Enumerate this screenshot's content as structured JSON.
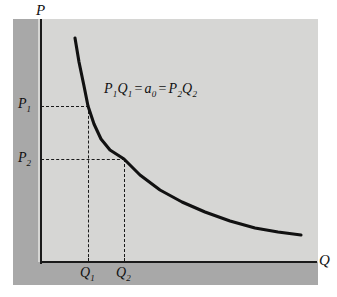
{
  "figure": {
    "background_color": "#ffffff",
    "panel_color": "#d6d6d4",
    "shadow_color": "#a8a8a8",
    "axis_color": "#1a1a1a",
    "curve_color": "#111111"
  },
  "axes": {
    "y_label": "P",
    "x_label": "Q"
  },
  "ticks": {
    "y": [
      {
        "id": "p1",
        "base": "P",
        "sub": "1"
      },
      {
        "id": "p2",
        "base": "P",
        "sub": "2"
      }
    ],
    "x": [
      {
        "id": "q1",
        "base": "Q",
        "sub": "1"
      },
      {
        "id": "q2",
        "base": "Q",
        "sub": "2"
      }
    ]
  },
  "annotation": {
    "equation_parts": [
      {
        "base": "P",
        "sub": "1"
      },
      {
        "base": "Q",
        "sub": "1"
      },
      {
        "op": "="
      },
      {
        "base": "a",
        "sub": "0"
      },
      {
        "op": "="
      },
      {
        "base": "P",
        "sub": "2"
      },
      {
        "base": "Q",
        "sub": "2"
      }
    ],
    "equation_text": "P1Q1 = a0 = P2Q2"
  },
  "chart_data": {
    "type": "line",
    "title": "",
    "xlabel": "Q",
    "ylabel": "P",
    "grid": false,
    "legend": null,
    "curve_name": "unit-elastic demand curve (rectangular hyperbola)",
    "relation": "P * Q = a0",
    "x": [
      75,
      79,
      84,
      88,
      94,
      101,
      110,
      124,
      140,
      160,
      182,
      205,
      230,
      255,
      278,
      301
    ],
    "y": [
      38,
      62,
      86,
      106,
      124,
      139,
      150,
      159,
      175,
      190,
      202,
      212,
      221,
      228,
      232,
      235
    ],
    "marked_points": [
      {
        "label": "P1Q1",
        "x_label": "Q1",
        "y_label": "P1",
        "x_px": 88,
        "y_px": 106
      },
      {
        "label": "P2Q2",
        "x_label": "Q2",
        "y_label": "P2",
        "x_px": 124,
        "y_px": 159
      }
    ],
    "annotations": [
      "P1Q1 = a0 = P2Q2"
    ],
    "axis_origin_px": [
      40,
      262
    ],
    "note": "Downward sloping convex demand curve; equal rectangular areas under both marked points."
  }
}
